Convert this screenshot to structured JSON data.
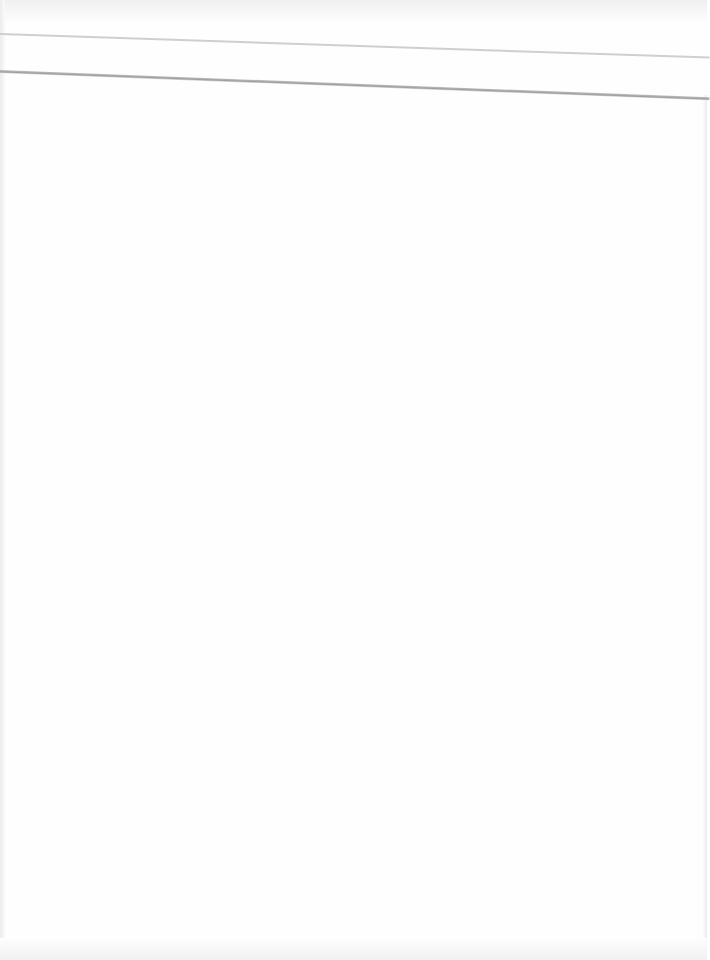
{
  "document": {
    "type": "scanned-page",
    "content": "blank",
    "text_lines": [],
    "rules": [
      {
        "name": "header-rule-thin",
        "color": "#cfcfcf"
      },
      {
        "name": "header-rule-thick",
        "color": "#a8a8a8"
      }
    ],
    "colors": {
      "paper": "#fefefe",
      "edge_shadow": "#ececec"
    }
  }
}
